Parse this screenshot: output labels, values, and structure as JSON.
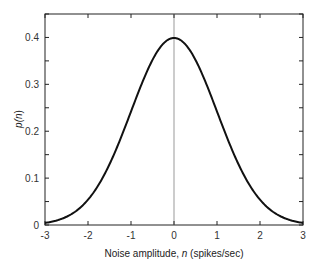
{
  "chart_data": {
    "type": "line",
    "title": "",
    "xlabel": "Noise amplitude, n (spikes/sec)",
    "xlabel_parts": {
      "prefix": "Noise amplitude, ",
      "var": "n",
      "suffix": " (spikes/sec)"
    },
    "ylabel": "p(n)",
    "ylabel_parts": {
      "prefix": "p(",
      "var": "n",
      "suffix": ")"
    },
    "xlim": [
      -3,
      3
    ],
    "ylim": [
      0,
      0.45
    ],
    "x_ticks": [
      "-3",
      "-2",
      "-1",
      "0",
      "1",
      "2",
      "3"
    ],
    "y_ticks": [
      "0",
      "0.1",
      "0.2",
      "0.3",
      "0.4"
    ],
    "grid": false,
    "legend": null,
    "annotations": [
      "vertical reference line at n = 0"
    ],
    "series": [
      {
        "name": "Gaussian noise distribution p(n)",
        "x": [
          -3,
          -2.5,
          -2,
          -1.5,
          -1,
          -0.5,
          0,
          0.5,
          1,
          1.5,
          2,
          2.5,
          3
        ],
        "values": [
          0.004,
          0.018,
          0.054,
          0.13,
          0.242,
          0.352,
          0.399,
          0.352,
          0.242,
          0.13,
          0.054,
          0.018,
          0.004
        ]
      }
    ],
    "colors": {
      "curve": "#111111",
      "axes": "#222222",
      "zero_line": "#999999"
    }
  }
}
